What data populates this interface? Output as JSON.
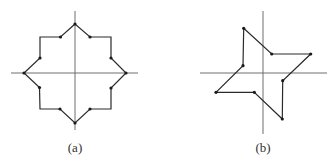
{
  "figures": [
    {
      "id": "a",
      "label": "(a)",
      "label_pos": [
        75,
        140
      ],
      "axes": {
        "horizontal": [
          11,
          73,
          138,
          73
        ],
        "vertical": [
          75,
          11,
          75,
          130
        ]
      },
      "polygon": [
        [
          75,
          24
        ],
        [
          60.5,
          37
        ],
        [
          40,
          37
        ],
        [
          40,
          58
        ],
        [
          24,
          73
        ],
        [
          39.5,
          87.5
        ],
        [
          40,
          109
        ],
        [
          60,
          109
        ],
        [
          75,
          123
        ],
        [
          90,
          109
        ],
        [
          111,
          109
        ],
        [
          111,
          88
        ],
        [
          126,
          73
        ],
        [
          111,
          58
        ],
        [
          111,
          37
        ],
        [
          90,
          37
        ]
      ],
      "vertices": [
        [
          60.5,
          37
        ],
        [
          40,
          58
        ],
        [
          39.5,
          87.5
        ],
        [
          60,
          109
        ],
        [
          90,
          109
        ],
        [
          111,
          88
        ],
        [
          111,
          58
        ],
        [
          90,
          37
        ],
        [
          75,
          24
        ],
        [
          24,
          73
        ],
        [
          126,
          73
        ],
        [
          75,
          123
        ]
      ]
    },
    {
      "id": "b",
      "label": "(b)",
      "label_pos": [
        263,
        140
      ],
      "axes": {
        "horizontal": [
          200,
          73,
          327,
          73
        ],
        "vertical": [
          263,
          11,
          263,
          134
        ]
      },
      "polygon": [
        [
          243.7,
          28.3
        ],
        [
          271.7,
          54
        ],
        [
          310.7,
          54
        ],
        [
          282.7,
          80.7
        ],
        [
          282.3,
          119
        ],
        [
          254.3,
          92.3
        ],
        [
          216,
          92.3
        ],
        [
          243,
          65.7
        ]
      ],
      "vertices": [
        [
          243.7,
          28.3
        ],
        [
          271.7,
          54
        ],
        [
          310.7,
          54
        ],
        [
          282.7,
          80.7
        ],
        [
          282.3,
          119
        ],
        [
          254.3,
          92.3
        ],
        [
          216,
          92.3
        ],
        [
          243,
          65.7
        ]
      ]
    }
  ]
}
